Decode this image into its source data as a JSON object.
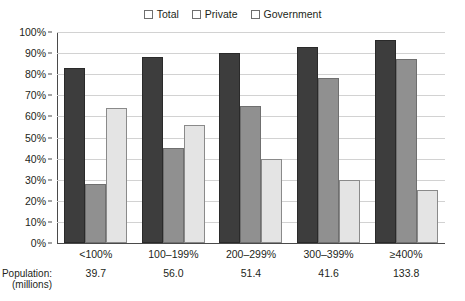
{
  "chart_data": {
    "type": "bar",
    "title": "",
    "xlabel": "",
    "ylabel": "",
    "ylim": [
      0,
      100
    ],
    "ytick_labels": [
      "100%",
      "90%",
      "80%",
      "70%",
      "60%",
      "50%",
      "40%",
      "30%",
      "20%",
      "10%",
      "0%"
    ],
    "ytick_values": [
      100,
      90,
      80,
      70,
      60,
      50,
      40,
      30,
      20,
      10,
      0
    ],
    "grid": true,
    "legend_position": "top-center",
    "categories": [
      "<100%",
      "100–199%",
      "200–299%",
      "300–399%",
      "≥400%"
    ],
    "series": [
      {
        "name": "Total",
        "color": "#3d3d3d",
        "values": [
          83,
          88,
          90,
          93,
          96
        ]
      },
      {
        "name": "Private",
        "color": "#909090",
        "values": [
          28,
          45,
          65,
          78,
          87
        ]
      },
      {
        "name": "Government",
        "color": "#e4e4e4",
        "values": [
          64,
          56,
          40,
          30,
          25
        ]
      }
    ],
    "annotations": {
      "population_caption_line1": "Population:",
      "population_caption_line2": "(millions)",
      "population_values": [
        "39.7",
        "56.0",
        "51.4",
        "41.6",
        "133.8"
      ]
    }
  }
}
